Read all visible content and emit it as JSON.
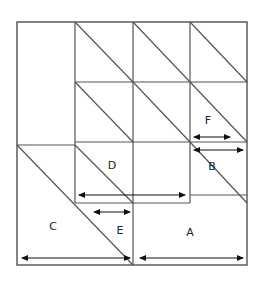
{
  "figure": {
    "stroke_color": "#444444",
    "arrow_color": "#111111",
    "background": "#ffffff",
    "outer_square": {
      "x": 17,
      "y": 22,
      "width": 230,
      "height": 243
    },
    "labels": [
      {
        "id": "A",
        "text": "A",
        "x": 190,
        "y": 236
      },
      {
        "id": "B",
        "text": "B",
        "x": 212,
        "y": 170
      },
      {
        "id": "C",
        "text": "C",
        "x": 53,
        "y": 230
      },
      {
        "id": "D",
        "text": "D",
        "x": 112,
        "y": 169
      },
      {
        "id": "E",
        "text": "E",
        "x": 120,
        "y": 234
      },
      {
        "id": "F",
        "text": "F",
        "x": 208,
        "y": 124
      }
    ],
    "grid_lines": {
      "verticals_x": [
        75,
        133,
        190
      ],
      "horizontals_y": [
        82,
        142,
        145,
        195,
        203
      ]
    },
    "dimension_arrows": [
      {
        "id": "arrow-A",
        "label": "A",
        "x1": 140,
        "x2": 243,
        "y": 258,
        "length_px": 103
      },
      {
        "id": "arrow-B",
        "label": "B",
        "x1": 194,
        "x2": 243,
        "y": 150,
        "length_px": 49
      },
      {
        "id": "arrow-C",
        "label": "C",
        "x1": 22,
        "x2": 130,
        "y": 258,
        "length_px": 108
      },
      {
        "id": "arrow-D",
        "label": "D",
        "x1": 79,
        "x2": 185,
        "y": 195,
        "length_px": 106
      },
      {
        "id": "arrow-E",
        "label": "E",
        "x1": 94,
        "x2": 130,
        "y": 212,
        "length_px": 36
      },
      {
        "id": "arrow-F",
        "label": "F",
        "x1": 194,
        "x2": 230,
        "y": 137,
        "length_px": 36
      }
    ],
    "diagonals": [
      {
        "id": "diag-top-1",
        "x1": 75,
        "y1": 22,
        "x2": 133,
        "y2": 82
      },
      {
        "id": "diag-top-2",
        "x1": 133,
        "y1": 22,
        "x2": 190,
        "y2": 82
      },
      {
        "id": "diag-top-3",
        "x1": 190,
        "y1": 22,
        "x2": 247,
        "y2": 82
      },
      {
        "id": "diag-mid-1",
        "x1": 75,
        "y1": 82,
        "x2": 133,
        "y2": 142
      },
      {
        "id": "diag-mid-2",
        "x1": 133,
        "y1": 82,
        "x2": 190,
        "y2": 142
      },
      {
        "id": "diag-mid-3",
        "x1": 190,
        "y1": 82,
        "x2": 247,
        "y2": 142
      },
      {
        "id": "diag-D",
        "x1": 75,
        "y1": 145,
        "x2": 133,
        "y2": 203
      },
      {
        "id": "diag-B",
        "x1": 190,
        "y1": 142,
        "x2": 247,
        "y2": 203
      },
      {
        "id": "diag-C",
        "x1": 17,
        "y1": 145,
        "x2": 133,
        "y2": 265
      }
    ]
  }
}
